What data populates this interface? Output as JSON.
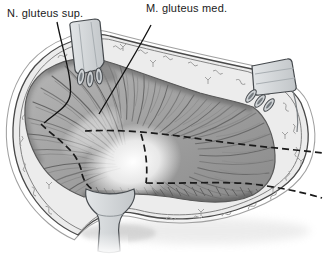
{
  "figure": {
    "kind": "surgical-anatomy-illustration",
    "labels": {
      "nerve": {
        "text": "N. gluteus sup."
      },
      "muscle": {
        "text": "M. gluteus med."
      }
    },
    "colors": {
      "background": "#ffffff",
      "fat_band": "#ececec",
      "fat_texture": "#9a9a9a",
      "muscle_light": "#b3b3b3",
      "muscle_dark": "#8c8c8c",
      "outline": "#4a4a4a",
      "annotation": "#1a1a1a",
      "retractor_fill": "#d5d8db",
      "retractor_stroke": "#45494d"
    },
    "elements": [
      "wound-skin-edge",
      "subcutaneous-fat-band",
      "gluteus-medius-muscle",
      "greater-trochanter-highlight",
      "dashed-incision-line",
      "rake-retractor-top-left",
      "rake-retractor-right",
      "smooth-retractor-bottom"
    ]
  }
}
